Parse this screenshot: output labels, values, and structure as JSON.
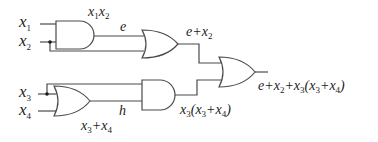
{
  "diagram": {
    "type": "logic-circuit",
    "inputs": [
      {
        "id": "x1",
        "label": "x",
        "sub": "1"
      },
      {
        "id": "x2",
        "label": "x",
        "sub": "2"
      },
      {
        "id": "x3",
        "label": "x",
        "sub": "3"
      },
      {
        "id": "x4",
        "label": "x",
        "sub": "4"
      }
    ],
    "gates": [
      {
        "id": "and1",
        "type": "AND",
        "inputs": [
          "x1",
          "x2"
        ],
        "output_label": "x1x2",
        "wire_label": "e"
      },
      {
        "id": "or1",
        "type": "OR",
        "inputs": [
          "e",
          "x2"
        ],
        "output_label": "e+x2"
      },
      {
        "id": "or3",
        "type": "OR",
        "inputs": [
          "x3",
          "x4"
        ],
        "output_label": "x3+x4",
        "wire_label": "h"
      },
      {
        "id": "and2",
        "type": "AND",
        "inputs": [
          "x3",
          "h"
        ],
        "output_label": "x3(x3+x4)"
      },
      {
        "id": "or2",
        "type": "OR",
        "inputs": [
          "e+x2",
          "x3(x3+x4)"
        ],
        "output_label": "e+x2+x3(x3+x4)"
      }
    ],
    "labels": {
      "x1_x": "x",
      "x1_sub": "1",
      "x2_x": "x",
      "x2_sub": "2",
      "x3_x": "x",
      "x3_sub": "3",
      "x4_x": "x",
      "x4_sub": "4",
      "and1_out_a": "x",
      "and1_out_a_sub": "1",
      "and1_out_b": "x",
      "and1_out_b_sub": "2",
      "e": "e",
      "or1_out_e": "e+x",
      "or1_out_sub": "2",
      "h": "h",
      "or3_out_a": "x",
      "or3_out_a_sub": "3",
      "or3_out_plus": "+x",
      "or3_out_b_sub": "4",
      "and2_out_a": "x",
      "and2_out_a_sub": "3",
      "and2_out_paren": "(x",
      "and2_out_b_sub": "3",
      "and2_out_plus": "+x",
      "and2_out_c_sub": "4",
      "and2_out_close": ")",
      "final_e": "e+x",
      "final_sub1": "2",
      "final_plus": "+x",
      "final_sub2": "3",
      "final_paren": "(x",
      "final_sub3": "3",
      "final_plus2": "+x",
      "final_sub4": "4",
      "final_close": ")"
    },
    "colors": {
      "stroke": "#4a4a4a",
      "text": "#222222",
      "background": "#ffffff"
    }
  }
}
